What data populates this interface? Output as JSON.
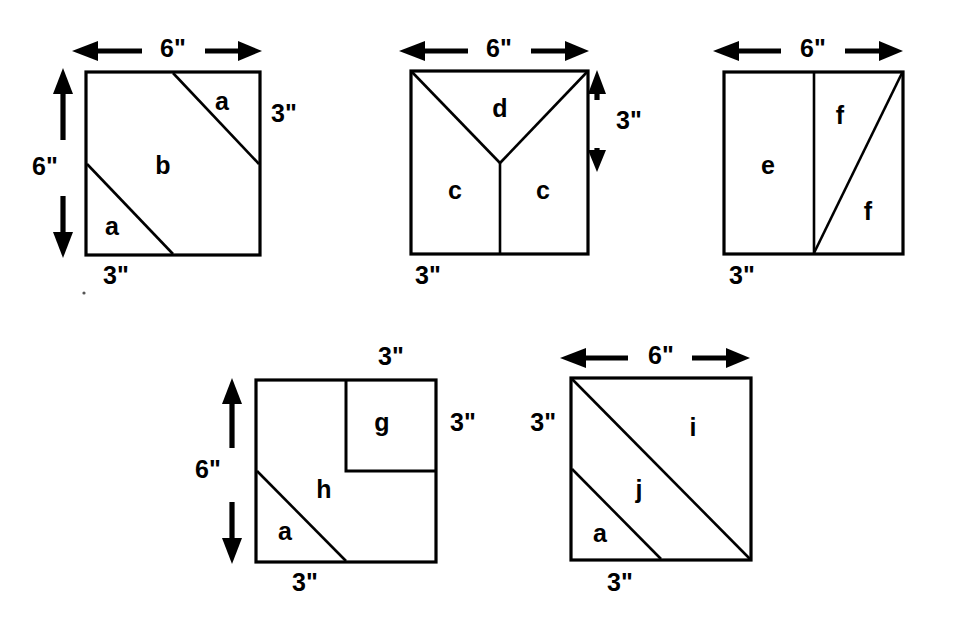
{
  "page": {
    "background_color": "#ffffff",
    "ink_color": "#000000",
    "width": 953,
    "height": 630
  },
  "figures": [
    {
      "id": "figure-1",
      "name": "square-1",
      "description": "6-inch square cut by two parallel diagonals into two triangles and a middle hexagon",
      "square": {
        "x": 86,
        "y": 72,
        "width": 174,
        "height": 183
      },
      "regions": [
        {
          "label": "a",
          "x": 222,
          "y": 103
        },
        {
          "label": "b",
          "x": 163,
          "y": 167
        },
        {
          "label": "a",
          "x": 112,
          "y": 228
        }
      ],
      "dimensions": [
        {
          "label": "6\"",
          "orientation": "horizontal",
          "position": "top",
          "x": 173,
          "y": 51
        },
        {
          "label": "6\"",
          "orientation": "vertical",
          "position": "left",
          "x": 45,
          "y": 168
        },
        {
          "label": "3\"",
          "orientation": "none",
          "position": "right",
          "x": 271,
          "y": 115
        },
        {
          "label": "3\"",
          "orientation": "none",
          "position": "bottom",
          "x": 116,
          "y": 277
        }
      ]
    },
    {
      "id": "figure-2",
      "name": "square-2",
      "description": "6-inch square cut with a Y: two diagonals from the top corners meeting at center then a vertical line to the bottom edge",
      "square": {
        "x": 411,
        "y": 71,
        "width": 177,
        "height": 183
      },
      "regions": [
        {
          "label": "d",
          "x": 500,
          "y": 110
        },
        {
          "label": "c",
          "x": 455,
          "y": 192
        },
        {
          "label": "c",
          "x": 543,
          "y": 192
        }
      ],
      "dimensions": [
        {
          "label": "6\"",
          "orientation": "horizontal",
          "position": "top",
          "x": 499,
          "y": 51
        },
        {
          "label": "3\"",
          "orientation": "vertical",
          "position": "right",
          "x": 615,
          "y": 122
        },
        {
          "label": "3\"",
          "orientation": "none",
          "position": "bottom",
          "x": 428,
          "y": 277
        }
      ]
    },
    {
      "id": "figure-3",
      "name": "square-3",
      "description": "6-inch square split in half vertically; the right half cut by a diagonal from bottom-center to the top-right corner",
      "square": {
        "x": 724,
        "y": 72,
        "width": 179,
        "height": 182
      },
      "regions": [
        {
          "label": "e",
          "x": 768,
          "y": 167
        },
        {
          "label": "f",
          "x": 840,
          "y": 117
        },
        {
          "label": "f",
          "x": 868,
          "y": 213
        }
      ],
      "dimensions": [
        {
          "label": "6\"",
          "orientation": "horizontal",
          "position": "top",
          "x": 813,
          "y": 51
        },
        {
          "label": "3\"",
          "orientation": "none",
          "position": "bottom",
          "x": 742,
          "y": 277
        }
      ]
    },
    {
      "id": "figure-4",
      "name": "square-4",
      "description": "6-inch square with a 3-inch square g in the top-right quadrant and a diagonal from left-mid to bottom-center forming triangle a",
      "square": {
        "x": 256,
        "y": 380,
        "width": 180,
        "height": 182
      },
      "inner_square": {
        "x": 346,
        "y": 380,
        "width": 90,
        "height": 91
      },
      "regions": [
        {
          "label": "g",
          "x": 382,
          "y": 424
        },
        {
          "label": "h",
          "x": 324,
          "y": 491
        },
        {
          "label": "a",
          "x": 285,
          "y": 533
        }
      ],
      "dimensions": [
        {
          "label": "3\"",
          "orientation": "none",
          "position": "top",
          "x": 391,
          "y": 358
        },
        {
          "label": "3\"",
          "orientation": "none",
          "position": "right",
          "x": 457,
          "y": 424
        },
        {
          "label": "6\"",
          "orientation": "vertical",
          "position": "left",
          "x": 238,
          "y": 471
        },
        {
          "label": "3\"",
          "orientation": "none",
          "position": "bottom",
          "x": 305,
          "y": 584
        }
      ]
    },
    {
      "id": "figure-5",
      "name": "square-5",
      "description": "6-inch square cut by the main diagonal and a parallel diagonal from left-mid to bottom-center",
      "square": {
        "x": 571,
        "y": 378,
        "width": 180,
        "height": 182
      },
      "regions": [
        {
          "label": "i",
          "x": 693,
          "y": 429
        },
        {
          "label": "j",
          "x": 639,
          "y": 491
        },
        {
          "label": "a",
          "x": 600,
          "y": 535
        }
      ],
      "dimensions": [
        {
          "label": "6\"",
          "orientation": "horizontal",
          "position": "top",
          "x": 661,
          "y": 358
        },
        {
          "label": "3\"",
          "orientation": "none",
          "position": "left",
          "x": 545,
          "y": 424
        },
        {
          "label": "3\"",
          "orientation": "none",
          "position": "bottom",
          "x": 620,
          "y": 584
        }
      ]
    }
  ],
  "labels": {
    "six_inch": "6\"",
    "three_inch": "3\"",
    "a": "a",
    "b": "b",
    "c": "c",
    "d": "d",
    "e": "e",
    "f": "f",
    "g": "g",
    "h": "h",
    "i": "i",
    "j": "j"
  }
}
